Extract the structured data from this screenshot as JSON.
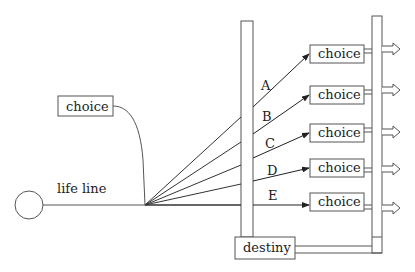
{
  "diagram": {
    "type": "flow",
    "start_node": {
      "shape": "circle",
      "label": ""
    },
    "lifeline_label": "life line",
    "side_choice": {
      "label": "choice"
    },
    "branches": [
      {
        "label": "A",
        "target": "choice"
      },
      {
        "label": "B",
        "target": "choice"
      },
      {
        "label": "C",
        "target": "choice"
      },
      {
        "label": "D",
        "target": "choice"
      },
      {
        "label": "E",
        "target": "choice"
      }
    ],
    "destiny": {
      "label": "destiny"
    },
    "colors": {
      "stroke": "#555555",
      "arrow": "#222222",
      "text": "#222222",
      "background": "#ffffff"
    }
  }
}
